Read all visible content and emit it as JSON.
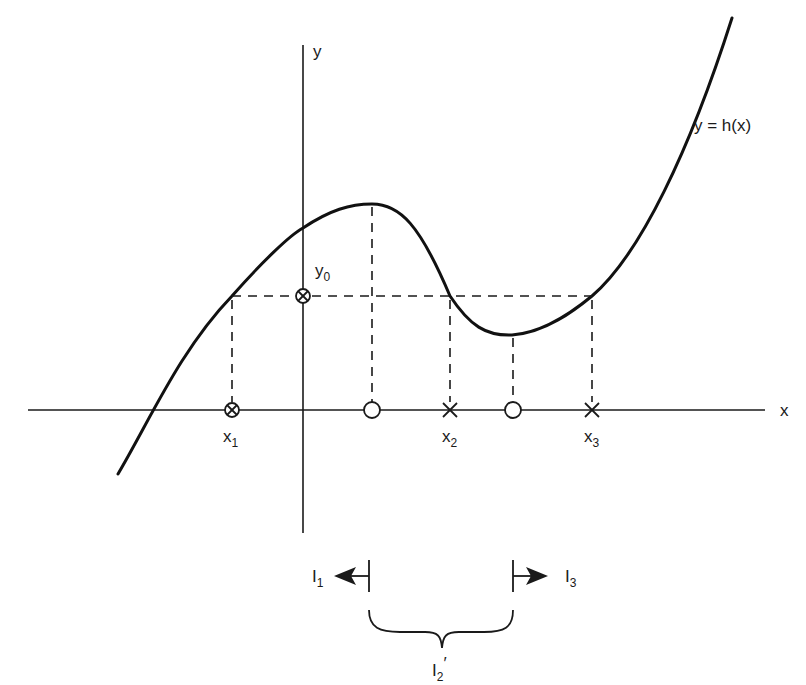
{
  "figure": {
    "axis_x_label": "x",
    "axis_y_label": "y",
    "curve_label": "y = h(x)",
    "y0": {
      "base": "y",
      "sub": "0"
    },
    "x1": {
      "base": "x",
      "sub": "1"
    },
    "x2": {
      "base": "x",
      "sub": "2"
    },
    "x3": {
      "base": "x",
      "sub": "3"
    },
    "interval_1": {
      "base": "I",
      "sub": "1"
    },
    "interval_3": {
      "base": "I",
      "sub": "3"
    },
    "interval_2p": {
      "base": "I",
      "sub": "2",
      "prime": "′"
    }
  },
  "markers": {
    "x1": "circle-cross",
    "y0": "circle-cross",
    "local_max_x": "open-circle",
    "x2": "cross",
    "local_min_x": "open-circle",
    "x3": "cross"
  },
  "colors": {
    "ink": "#1a1a1a",
    "background": "#ffffff"
  }
}
